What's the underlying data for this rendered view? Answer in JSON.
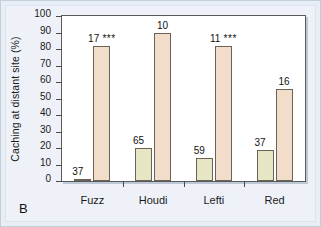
{
  "panel": {
    "letter": "B"
  },
  "chart_data": {
    "type": "bar",
    "title": "",
    "subtitle": "",
    "xlabel": "",
    "ylabel": "Caching at distant site (%)",
    "ylim": [
      0,
      100
    ],
    "ytick_step": 10,
    "yticks": [
      100,
      90,
      80,
      70,
      60,
      50,
      40,
      30,
      20,
      10,
      0
    ],
    "grid": false,
    "legend": "none",
    "categories": [
      "Fuzz",
      "Houdi",
      "Lefti",
      "Red"
    ],
    "series": [
      {
        "name": "series-1",
        "color": "#e7e6c4",
        "values": [
          1.5,
          20,
          14,
          19
        ],
        "annotations": [
          "37",
          "65",
          "59",
          "37"
        ]
      },
      {
        "name": "series-2",
        "color": "#f2ddcb",
        "values": [
          82,
          90,
          82,
          56
        ],
        "annotations": [
          "17",
          "10",
          "11",
          "16"
        ],
        "significance": [
          "***",
          "",
          "***",
          ""
        ]
      }
    ],
    "bar_labels": [
      {
        "text": "37",
        "sig": ""
      },
      {
        "text": "17",
        "sig": "***"
      },
      {
        "text": "65",
        "sig": ""
      },
      {
        "text": "10",
        "sig": ""
      },
      {
        "text": "59",
        "sig": ""
      },
      {
        "text": "11",
        "sig": "***"
      },
      {
        "text": "37",
        "sig": ""
      },
      {
        "text": "16",
        "sig": ""
      }
    ]
  }
}
